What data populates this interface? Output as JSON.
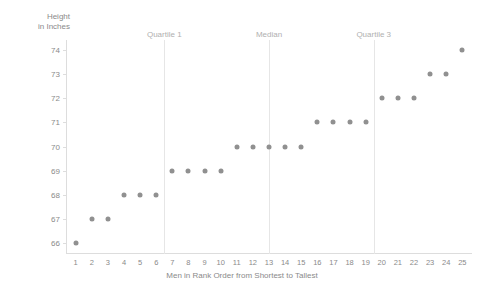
{
  "chart_data": {
    "type": "scatter",
    "title": "",
    "xlabel": "Men in Rank Order from Shortest to Tallest",
    "ylabel": "Height\nin Inches",
    "x": [
      1,
      2,
      3,
      4,
      5,
      6,
      7,
      8,
      9,
      10,
      11,
      12,
      13,
      14,
      15,
      16,
      17,
      18,
      19,
      20,
      21,
      22,
      23,
      24,
      25
    ],
    "values": [
      66,
      67,
      67,
      68,
      68,
      68,
      69,
      69,
      69,
      69,
      70,
      70,
      70,
      70,
      70,
      71,
      71,
      71,
      71,
      72,
      72,
      72,
      73,
      73,
      74
    ],
    "xlim": [
      0.4,
      25.6
    ],
    "ylim": [
      65.6,
      74.4
    ],
    "xticks": [
      "1",
      "2",
      "3",
      "4",
      "5",
      "6",
      "7",
      "8",
      "9",
      "10",
      "11",
      "12",
      "13",
      "14",
      "15",
      "16",
      "17",
      "18",
      "19",
      "20",
      "21",
      "22",
      "23",
      "24",
      "25"
    ],
    "yticks": [
      "66",
      "67",
      "68",
      "69",
      "70",
      "71",
      "72",
      "73",
      "74"
    ],
    "grid": false,
    "legend": "none",
    "annotations": [
      {
        "label": "Quartile 1",
        "x": 6.5
      },
      {
        "label": "Median",
        "x": 13.0
      },
      {
        "label": "Quartile 3",
        "x": 19.5
      }
    ],
    "colors": {
      "dot": "#909090",
      "axis": "#dddddd",
      "reference_line": "#e6e6e6",
      "tick_text": "#8a8a8a",
      "annotation_text": "#b0b0b0",
      "background": "#ffffff"
    }
  }
}
